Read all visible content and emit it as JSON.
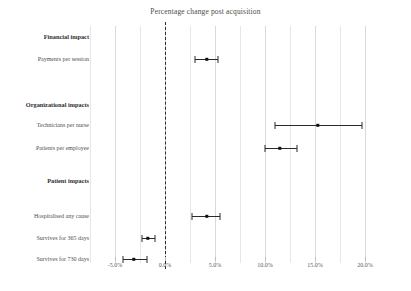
{
  "chart_data": {
    "type": "scatter",
    "subtype": "forest-plot",
    "title": "Percentage change post acquisition",
    "xlabel": "",
    "ylabel": "",
    "xlim": [
      -7.5,
      22.5
    ],
    "grid": true,
    "legend": null,
    "reference_line": {
      "value": 0.0,
      "style": "dashed",
      "color": "#2b2b2b"
    },
    "xticks": [
      {
        "value": -5.0,
        "label": "-5.0%"
      },
      {
        "value": 0.0,
        "label": "0.0%"
      },
      {
        "value": 5.0,
        "label": "5.0%"
      },
      {
        "value": 10.0,
        "label": "10.0%"
      },
      {
        "value": 15.0,
        "label": "15.0%"
      },
      {
        "value": 20.0,
        "label": "20.0%"
      }
    ],
    "minor_gridlines": [
      -7.5,
      -2.5,
      2.5,
      7.5,
      12.5,
      17.5
    ],
    "rows": [
      {
        "kind": "group",
        "label": "Financial impact",
        "y": 37
      },
      {
        "kind": "estimate",
        "label": "Payments per session",
        "y": 59,
        "estimate": 4.2,
        "ci_low": 3.0,
        "ci_high": 5.3
      },
      {
        "kind": "group",
        "label": "Organizational impacts",
        "y": 105
      },
      {
        "kind": "estimate",
        "label": "Technicians per nurse",
        "y": 125,
        "estimate": 15.3,
        "ci_low": 11.0,
        "ci_high": 19.7
      },
      {
        "kind": "estimate",
        "label": "Patients per employee",
        "y": 148,
        "estimate": 11.5,
        "ci_low": 10.0,
        "ci_high": 13.2
      },
      {
        "kind": "group",
        "label": "Patient impacts",
        "y": 181
      },
      {
        "kind": "estimate",
        "label": "Hospitalised any cause",
        "y": 216,
        "estimate": 4.2,
        "ci_low": 2.7,
        "ci_high": 5.5
      },
      {
        "kind": "estimate",
        "label": "Survives for 365 days",
        "y": 238,
        "estimate": -1.7,
        "ci_low": -2.3,
        "ci_high": -1.0
      },
      {
        "kind": "estimate",
        "label": "Survives for 730 days",
        "y": 259,
        "estimate": -3.1,
        "ci_low": -4.2,
        "ci_high": -1.8
      }
    ]
  }
}
